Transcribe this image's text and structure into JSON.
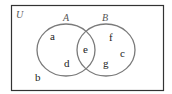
{
  "universe": {
    "label": "U"
  },
  "sets": [
    {
      "label": "A",
      "elements_only": [
        "a",
        "d"
      ]
    },
    {
      "label": "B",
      "elements_only": [
        "f",
        "c",
        "g"
      ]
    }
  ],
  "intersection": [
    "e"
  ],
  "outside": [
    "b"
  ],
  "colors": {
    "border": "#333333",
    "circle": "#7a7a7a",
    "text": "#222222"
  }
}
